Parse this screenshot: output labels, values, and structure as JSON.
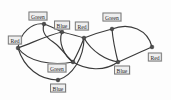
{
  "diagram": {
    "background_color": "#fdfdfd",
    "edge_color": "#3a3a3a",
    "vertex_color": "#4d4d4d",
    "label_background": "#efefef",
    "label_border": "#7a7a7a",
    "nodes": [
      {
        "id": "n1",
        "label": "Green",
        "x": 44,
        "y": 24,
        "label_x": 38,
        "label_y": 16
      },
      {
        "id": "n2",
        "label": "Blue",
        "x": 62,
        "y": 32,
        "label_x": 62,
        "label_y": 25
      },
      {
        "id": "n3",
        "label": "Red",
        "x": 84,
        "y": 38,
        "label_x": 82,
        "label_y": 26
      },
      {
        "id": "n4",
        "label": "Green",
        "x": 112,
        "y": 29,
        "label_x": 112,
        "label_y": 17
      },
      {
        "id": "n5",
        "label": "Red",
        "x": 18,
        "y": 48,
        "label_x": 15,
        "label_y": 40
      },
      {
        "id": "n6",
        "label": "Red",
        "x": 152,
        "y": 47,
        "label_x": 155,
        "label_y": 57
      },
      {
        "id": "n7",
        "label": "Blue",
        "x": 118,
        "y": 62,
        "label_x": 122,
        "label_y": 70
      },
      {
        "id": "n8",
        "label": "Green",
        "x": 73,
        "y": 62,
        "label_x": 57,
        "label_y": 68
      },
      {
        "id": "n9",
        "label": "Blue",
        "x": 58,
        "y": 80,
        "label_x": 58,
        "label_y": 88
      }
    ],
    "edges": [
      {
        "from": "n5",
        "to": "n1",
        "curve": "arc-up"
      },
      {
        "from": "n5",
        "to": "n2",
        "curve": "straight"
      },
      {
        "from": "n5",
        "to": "n8",
        "curve": "arc-down"
      },
      {
        "from": "n5",
        "to": "n9",
        "curve": "arc-down"
      },
      {
        "from": "n1",
        "to": "n2",
        "curve": "arc-down"
      },
      {
        "from": "n1",
        "to": "n8",
        "curve": "wave"
      },
      {
        "from": "n2",
        "to": "n3",
        "curve": "straight"
      },
      {
        "from": "n2",
        "to": "n8",
        "curve": "arc-down"
      },
      {
        "from": "n3",
        "to": "n4",
        "curve": "straight"
      },
      {
        "from": "n3",
        "to": "n7",
        "curve": "arc-down"
      },
      {
        "from": "n3",
        "to": "n8",
        "curve": "straight"
      },
      {
        "from": "n3",
        "to": "n9",
        "curve": "arc-down"
      },
      {
        "from": "n4",
        "to": "n6",
        "curve": "arc-up"
      },
      {
        "from": "n4",
        "to": "n7",
        "curve": "straight"
      },
      {
        "from": "n6",
        "to": "n7",
        "curve": "straight"
      },
      {
        "from": "n7",
        "to": "n8",
        "curve": "arc-down"
      }
    ],
    "color_counts": {
      "Green": 3,
      "Blue": 3,
      "Red": 3
    }
  }
}
